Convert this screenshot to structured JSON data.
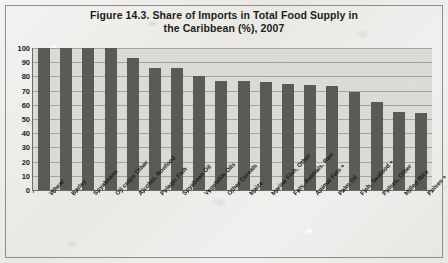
{
  "chart_data": {
    "type": "bar",
    "title": "Figure 14.3. Share of Imports in Total Food Supply in the Caribbean (%), 2007",
    "title_line1": "Figure 14.3. Share of Imports in Total Food Supply in",
    "title_line2": "the Caribbean (%), 2007",
    "xlabel": "",
    "ylabel": "",
    "ylim": [
      0,
      100
    ],
    "yticks": [
      100,
      90,
      80,
      70,
      60,
      50,
      40,
      30,
      20,
      10,
      0
    ],
    "grid": true,
    "legend": "none",
    "bar_color": "#5c5a57",
    "plot_background": "#d6d5d2",
    "categories": [
      "Wheat",
      "Barley",
      "Soyabeans",
      "Oil crops Other",
      "Alcohol, Nonfood",
      "Pelagic Fish",
      "Soyabean Oil",
      "Vegetable Oils",
      "Other Cereals",
      "Maize",
      "Marine Fish, Other",
      "Fats, Animals, Raw",
      "Animal Fats +",
      "Palm Oil",
      "Fish, Seafood +",
      "Pulses, Other",
      "Milled Rice",
      "Pulses +"
    ],
    "values": [
      100,
      100,
      100,
      100,
      93,
      86,
      86,
      80,
      77,
      77,
      76,
      75,
      74,
      73,
      69,
      62,
      55,
      54
    ]
  }
}
